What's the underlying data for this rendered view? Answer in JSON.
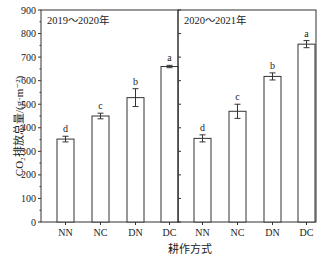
{
  "chart_data": {
    "type": "bar",
    "ylabel": "CO₂排放总量/(g·m⁻²)",
    "xlabel": "耕作方式",
    "ylim": [
      0,
      900
    ],
    "yticks": [
      0,
      100,
      200,
      300,
      400,
      500,
      600,
      700,
      800,
      900
    ],
    "categories": [
      "NN",
      "NC",
      "DN",
      "DC"
    ],
    "grid": false,
    "panels": [
      {
        "title": "2019～2020年",
        "values": [
          352,
          450,
          528,
          660
        ],
        "errors": [
          12,
          12,
          38,
          5
        ],
        "letters": [
          "d",
          "c",
          "b",
          "a"
        ]
      },
      {
        "title": "2020～2021年",
        "values": [
          355,
          470,
          618,
          755
        ],
        "errors": [
          15,
          30,
          15,
          15
        ],
        "letters": [
          "d",
          "c",
          "b",
          "a"
        ]
      }
    ]
  }
}
